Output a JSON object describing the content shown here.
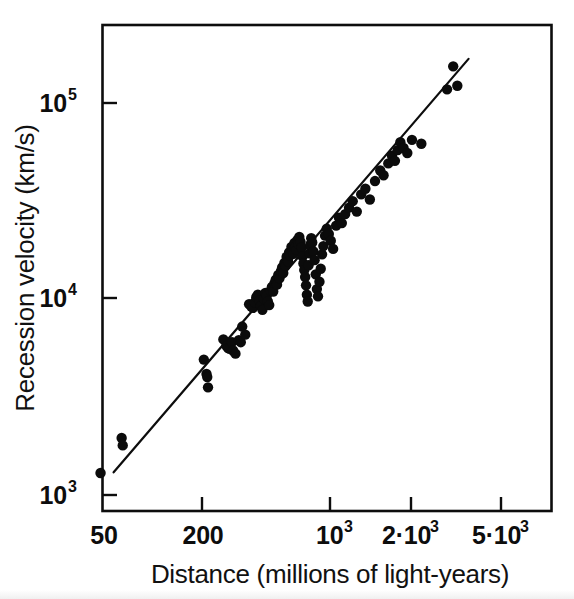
{
  "chart_data": {
    "type": "scatter",
    "title": "",
    "subtitle": "",
    "xlabel": "Distance (millions of light-years)",
    "ylabel": "Recession velocity (km/s)",
    "xscale": "log",
    "yscale": "log",
    "xlim": [
      50,
      6200
    ],
    "ylim": [
      820,
      200000
    ],
    "grid": false,
    "legend": null,
    "x_tick_labels": [
      "50",
      "200",
      "10³",
      "2·10³",
      "5·10³"
    ],
    "x_tick_values": [
      50,
      200,
      1000,
      2000,
      5000
    ],
    "y_tick_labels": [
      "10³",
      "10⁴",
      "10⁵"
    ],
    "y_tick_values": [
      1000,
      10000,
      100000
    ],
    "annotations": [],
    "fit_line": {
      "label": "Hubble law fit",
      "x_start": 66,
      "y_start": 1290,
      "x_end": 5700,
      "y_end": 166000,
      "slope": 1.0
    },
    "points": [
      {
        "x": 52,
        "y": 960
      },
      {
        "x": 56,
        "y": 1280
      },
      {
        "x": 73,
        "y": 1930
      },
      {
        "x": 74,
        "y": 1770
      },
      {
        "x": 205,
        "y": 4850
      },
      {
        "x": 212,
        "y": 4100
      },
      {
        "x": 214,
        "y": 3950
      },
      {
        "x": 216,
        "y": 3500
      },
      {
        "x": 262,
        "y": 6150
      },
      {
        "x": 272,
        "y": 5700
      },
      {
        "x": 278,
        "y": 5550
      },
      {
        "x": 284,
        "y": 5500
      },
      {
        "x": 292,
        "y": 5950
      },
      {
        "x": 296,
        "y": 5400
      },
      {
        "x": 305,
        "y": 5200
      },
      {
        "x": 318,
        "y": 6100
      },
      {
        "x": 326,
        "y": 5950
      },
      {
        "x": 332,
        "y": 7150
      },
      {
        "x": 345,
        "y": 6500
      },
      {
        "x": 362,
        "y": 9300
      },
      {
        "x": 372,
        "y": 9050
      },
      {
        "x": 380,
        "y": 8900
      },
      {
        "x": 388,
        "y": 9500
      },
      {
        "x": 396,
        "y": 10100
      },
      {
        "x": 404,
        "y": 10400
      },
      {
        "x": 412,
        "y": 9700
      },
      {
        "x": 420,
        "y": 9100
      },
      {
        "x": 428,
        "y": 8700
      },
      {
        "x": 436,
        "y": 9900
      },
      {
        "x": 444,
        "y": 10600
      },
      {
        "x": 452,
        "y": 10300
      },
      {
        "x": 458,
        "y": 9600
      },
      {
        "x": 466,
        "y": 9200
      },
      {
        "x": 474,
        "y": 10900
      },
      {
        "x": 482,
        "y": 11400
      },
      {
        "x": 490,
        "y": 10800
      },
      {
        "x": 498,
        "y": 11900
      },
      {
        "x": 506,
        "y": 12400
      },
      {
        "x": 514,
        "y": 11700
      },
      {
        "x": 522,
        "y": 13100
      },
      {
        "x": 530,
        "y": 12600
      },
      {
        "x": 540,
        "y": 13700
      },
      {
        "x": 548,
        "y": 14300
      },
      {
        "x": 556,
        "y": 13400
      },
      {
        "x": 564,
        "y": 15100
      },
      {
        "x": 572,
        "y": 14600
      },
      {
        "x": 580,
        "y": 16200
      },
      {
        "x": 590,
        "y": 15400
      },
      {
        "x": 598,
        "y": 17100
      },
      {
        "x": 606,
        "y": 16500
      },
      {
        "x": 616,
        "y": 18200
      },
      {
        "x": 624,
        "y": 17400
      },
      {
        "x": 632,
        "y": 16800
      },
      {
        "x": 640,
        "y": 19100
      },
      {
        "x": 648,
        "y": 18300
      },
      {
        "x": 656,
        "y": 17600
      },
      {
        "x": 664,
        "y": 19800
      },
      {
        "x": 672,
        "y": 18900
      },
      {
        "x": 680,
        "y": 20500
      },
      {
        "x": 690,
        "y": 19400
      },
      {
        "x": 700,
        "y": 18100
      },
      {
        "x": 708,
        "y": 16300
      },
      {
        "x": 716,
        "y": 15000
      },
      {
        "x": 724,
        "y": 13900
      },
      {
        "x": 732,
        "y": 12800
      },
      {
        "x": 740,
        "y": 11600
      },
      {
        "x": 748,
        "y": 10400
      },
      {
        "x": 756,
        "y": 9600
      },
      {
        "x": 764,
        "y": 14700
      },
      {
        "x": 772,
        "y": 16900
      },
      {
        "x": 780,
        "y": 18700
      },
      {
        "x": 790,
        "y": 20200
      },
      {
        "x": 800,
        "y": 19200
      },
      {
        "x": 812,
        "y": 17300
      },
      {
        "x": 824,
        "y": 15600
      },
      {
        "x": 836,
        "y": 13200
      },
      {
        "x": 848,
        "y": 11100
      },
      {
        "x": 860,
        "y": 10200
      },
      {
        "x": 876,
        "y": 12100
      },
      {
        "x": 890,
        "y": 14100
      },
      {
        "x": 905,
        "y": 16700
      },
      {
        "x": 920,
        "y": 18400
      },
      {
        "x": 940,
        "y": 20800
      },
      {
        "x": 960,
        "y": 22600
      },
      {
        "x": 985,
        "y": 21200
      },
      {
        "x": 1010,
        "y": 19600
      },
      {
        "x": 1040,
        "y": 17800
      },
      {
        "x": 1080,
        "y": 23400
      },
      {
        "x": 1120,
        "y": 25700
      },
      {
        "x": 1160,
        "y": 24100
      },
      {
        "x": 1210,
        "y": 26800
      },
      {
        "x": 1270,
        "y": 28900
      },
      {
        "x": 1330,
        "y": 31200
      },
      {
        "x": 1400,
        "y": 27600
      },
      {
        "x": 1480,
        "y": 33800
      },
      {
        "x": 1560,
        "y": 36100
      },
      {
        "x": 1650,
        "y": 31800
      },
      {
        "x": 1760,
        "y": 39500
      },
      {
        "x": 1880,
        "y": 44700
      },
      {
        "x": 1960,
        "y": 42300
      },
      {
        "x": 2080,
        "y": 48600
      },
      {
        "x": 2180,
        "y": 53200
      },
      {
        "x": 2260,
        "y": 50100
      },
      {
        "x": 2340,
        "y": 56800
      },
      {
        "x": 2420,
        "y": 62400
      },
      {
        "x": 2520,
        "y": 58300
      },
      {
        "x": 2640,
        "y": 54900
      },
      {
        "x": 2800,
        "y": 64100
      },
      {
        "x": 3150,
        "y": 61200
      },
      {
        "x": 4350,
        "y": 116000
      },
      {
        "x": 4700,
        "y": 152000
      },
      {
        "x": 4950,
        "y": 121000
      }
    ]
  },
  "axes": {
    "x_title": "Distance (millions of light-years)",
    "y_title": "Recession velocity (km/s)",
    "x_ticks": [
      {
        "label_base": "50",
        "label_exp": "",
        "value": 50
      },
      {
        "label_base": "200",
        "label_exp": "",
        "value": 200
      },
      {
        "label_base": "10",
        "label_exp": "3",
        "value": 1000
      },
      {
        "label_base": "2·10",
        "label_exp": "3",
        "value": 2000
      },
      {
        "label_base": "5·10",
        "label_exp": "3",
        "value": 5000
      }
    ],
    "y_ticks": [
      {
        "label_base": "10",
        "label_exp": "5",
        "value": 100000
      },
      {
        "label_base": "10",
        "label_exp": "4",
        "value": 10000
      },
      {
        "label_base": "10",
        "label_exp": "3",
        "value": 1000
      }
    ]
  },
  "style": {
    "ink_color": "#0d0d0d",
    "point_color": "#0b0b0b",
    "background_color": "#ffffff"
  }
}
